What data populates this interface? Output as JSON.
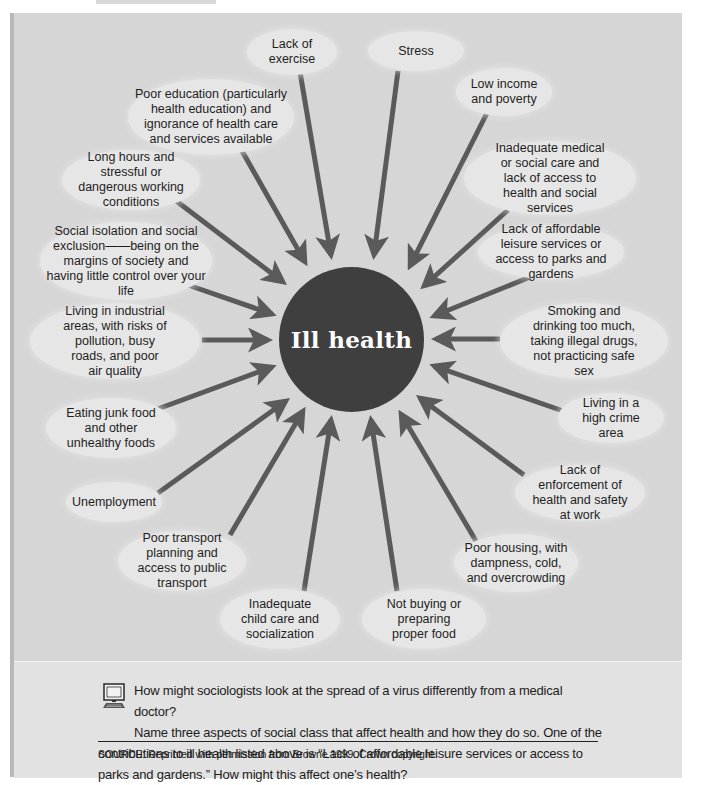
{
  "header": {
    "title_fragment": "Causes"
  },
  "center": {
    "label": "Ill health",
    "fill": "#3f3f3f",
    "text_color": "#ffffff"
  },
  "colors": {
    "background": "#d6d6d6",
    "oval": "#e6e6e6",
    "arrow": "#5a5a5a",
    "border": "#b8b8b8",
    "question_box": "#e2e2e2"
  },
  "causes": [
    {
      "id": "lack-of-exercise",
      "label": "Lack of exercise"
    },
    {
      "id": "stress",
      "label": "Stress"
    },
    {
      "id": "low-income",
      "label": "Low income and poverty"
    },
    {
      "id": "poor-education",
      "label": "Poor education (particularly health education) and ignorance of health care and services available"
    },
    {
      "id": "long-hours",
      "label": "Long hours and stressful or dangerous working conditions"
    },
    {
      "id": "inadequate-medical",
      "label": "Inadequate medical or social care and lack of access to health and social services"
    },
    {
      "id": "social-isolation",
      "label": "Social isolation and social exclusion——being on the margins of society and having little control over your life"
    },
    {
      "id": "lack-of-leisure",
      "label": "Lack of affordable leisure services or access to parks and gardens"
    },
    {
      "id": "industrial-areas",
      "label": "Living in industrial areas, with risks of pollution, busy roads, and poor air quality"
    },
    {
      "id": "smoking-drinking",
      "label": "Smoking and drinking too much, taking illegal drugs, not practicing safe sex"
    },
    {
      "id": "junk-food",
      "label": "Eating junk food and other unhealthy foods"
    },
    {
      "id": "high-crime",
      "label": "Living in a high crime area"
    },
    {
      "id": "unemployment",
      "label": "Unemployment"
    },
    {
      "id": "lack-of-enforcement",
      "label": "Lack of enforcement of health and safety at work"
    },
    {
      "id": "poor-transport",
      "label": "Poor transport planning and access to public transport"
    },
    {
      "id": "inadequate-child-care",
      "label": "Inadequate child care and socialization"
    },
    {
      "id": "not-buying-food",
      "label": "Not buying or preparing proper food"
    },
    {
      "id": "poor-housing",
      "label": "Poor housing, with dampness, cold, and overcrowding"
    }
  ],
  "question": {
    "icon": "computer-icon",
    "line1": "How might sociologists look at the spread of a virus differently from a medical doctor?",
    "rest": "Name three aspects of social class that affect health and how they do so. One of the contributions to ill health listed above is “Lack of affordable leisure services or access to parks and gardens.” How might this affect one’s health?"
  },
  "source": "SOURCE: Reprinted with permission from Browne 1999. Crown copyright."
}
